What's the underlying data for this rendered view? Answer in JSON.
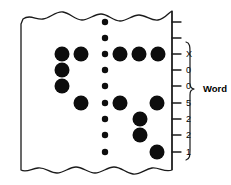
{
  "figure": {
    "card": {
      "left": 21,
      "right": 172,
      "top": 18,
      "bottom": 170,
      "edge_style": "torn-wavy",
      "fill_color": "#ffffff",
      "stroke_color": "#1a1a1a"
    },
    "rows": [
      {
        "index": 0,
        "y": 22,
        "label": ""
      },
      {
        "index": 1,
        "y": 38,
        "label": ""
      },
      {
        "index": 2,
        "y": 54,
        "label": "X"
      },
      {
        "index": 3,
        "y": 70,
        "label": "0"
      },
      {
        "index": 4,
        "y": 86,
        "label": "0"
      },
      {
        "index": 5,
        "y": 103,
        "label": "5"
      },
      {
        "index": 6,
        "y": 119,
        "label": "2"
      },
      {
        "index": 7,
        "y": 135,
        "label": "2"
      },
      {
        "index": 8,
        "y": 152,
        "label": "1"
      }
    ],
    "brace": {
      "label": "Word",
      "label_x": 203,
      "label_y": 89,
      "top": 42,
      "bottom": 160,
      "x": 188
    },
    "punch_holes": [
      {
        "cx": 62,
        "cy": 54,
        "r": 7.5,
        "size": "large"
      },
      {
        "cx": 62,
        "cy": 70,
        "r": 7.5,
        "size": "large"
      },
      {
        "cx": 62,
        "cy": 86,
        "r": 7.5,
        "size": "large"
      },
      {
        "cx": 81,
        "cy": 54,
        "r": 7.5,
        "size": "large"
      },
      {
        "cx": 81,
        "cy": 103,
        "r": 7.5,
        "size": "large"
      },
      {
        "cx": 120,
        "cy": 54,
        "r": 7.5,
        "size": "large"
      },
      {
        "cx": 139,
        "cy": 54,
        "r": 7.5,
        "size": "large"
      },
      {
        "cx": 158,
        "cy": 54,
        "r": 7.5,
        "size": "large"
      },
      {
        "cx": 120,
        "cy": 103,
        "r": 7.5,
        "size": "large"
      },
      {
        "cx": 157,
        "cy": 103,
        "r": 7.5,
        "size": "large"
      },
      {
        "cx": 140,
        "cy": 119,
        "r": 7.5,
        "size": "large"
      },
      {
        "cx": 140,
        "cy": 135,
        "r": 7.5,
        "size": "large"
      },
      {
        "cx": 157,
        "cy": 152,
        "r": 7.5,
        "size": "large"
      }
    ],
    "index_dots": [
      {
        "cx": 105,
        "cy": 22,
        "r": 3.2
      },
      {
        "cx": 105,
        "cy": 38,
        "r": 3.2
      },
      {
        "cx": 105,
        "cy": 54,
        "r": 3.2
      },
      {
        "cx": 105,
        "cy": 70,
        "r": 3.2
      },
      {
        "cx": 105,
        "cy": 86,
        "r": 3.2
      },
      {
        "cx": 105,
        "cy": 103,
        "r": 3.2
      },
      {
        "cx": 105,
        "cy": 119,
        "r": 3.2
      },
      {
        "cx": 105,
        "cy": 135,
        "r": 3.2
      },
      {
        "cx": 105,
        "cy": 152,
        "r": 3.2
      }
    ],
    "tick_marks": [
      {
        "y": 22,
        "x1": 172,
        "x2": 181
      },
      {
        "y": 38,
        "x1": 172,
        "x2": 181
      },
      {
        "y": 54,
        "x1": 172,
        "x2": 181
      },
      {
        "y": 70,
        "x1": 172,
        "x2": 181
      },
      {
        "y": 86,
        "x1": 172,
        "x2": 181
      },
      {
        "y": 103,
        "x1": 172,
        "x2": 181
      },
      {
        "y": 119,
        "x1": 172,
        "x2": 181
      },
      {
        "y": 135,
        "x1": 172,
        "x2": 181
      },
      {
        "y": 152,
        "x1": 172,
        "x2": 181
      }
    ],
    "tick_label_x": 186
  }
}
